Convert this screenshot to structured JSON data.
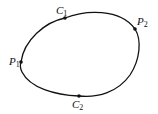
{
  "diagram": {
    "type": "closed-curve",
    "stroke_color": "#111111",
    "points": [
      {
        "name": "C",
        "sub": "1",
        "x": 65,
        "y": 18,
        "label_x": 56,
        "label_y": 14
      },
      {
        "name": "P",
        "sub": "2",
        "x": 135,
        "y": 29,
        "label_x": 137,
        "label_y": 25
      },
      {
        "name": "P",
        "sub": "1",
        "x": 21,
        "y": 62,
        "label_x": 9,
        "label_y": 65
      },
      {
        "name": "C",
        "sub": "2",
        "x": 79,
        "y": 96,
        "label_x": 72,
        "label_y": 108
      }
    ]
  }
}
